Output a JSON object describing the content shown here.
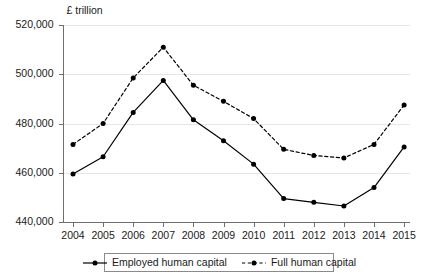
{
  "chart_data": {
    "type": "line",
    "title": "",
    "subtitle": "",
    "unit_label": "£ trillion",
    "xlabel": "",
    "ylabel": "",
    "ylim": [
      440000,
      520000
    ],
    "ytick_step": 20000,
    "ytick_labels": [
      "520,000",
      "500,000",
      "480,000",
      "460,000",
      "440,000"
    ],
    "ytick_values": [
      520000,
      500000,
      480000,
      460000,
      440000
    ],
    "categories": [
      "2004",
      "2005",
      "2006",
      "2007",
      "2008",
      "2009",
      "2010",
      "2011",
      "2012",
      "2013",
      "2014",
      "2015"
    ],
    "x": [
      2004,
      2005,
      2006,
      2007,
      2008,
      2009,
      2010,
      2011,
      2012,
      2013,
      2014,
      2015
    ],
    "grid": true,
    "grid_axis": "y",
    "legend_position": "bottom",
    "series": [
      {
        "name": "Employed human capital",
        "style": "solid",
        "color": "#000000",
        "marker": "circle",
        "values": [
          459500,
          466500,
          484500,
          497500,
          481500,
          473000,
          463500,
          449500,
          448000,
          446500,
          454000,
          470500
        ]
      },
      {
        "name": "Full human capital",
        "style": "dashed",
        "color": "#000000",
        "marker": "circle",
        "values": [
          471500,
          480000,
          498500,
          511000,
          495500,
          489000,
          482000,
          469500,
          467000,
          466000,
          471500,
          487500
        ]
      }
    ]
  },
  "legend": {
    "entries": [
      {
        "label": "Employed human capital",
        "style": "solid"
      },
      {
        "label": "Full human capital",
        "style": "dashed"
      }
    ]
  },
  "colors": {
    "series": "#000000",
    "axis": "#6f6f6f",
    "grid": "#e6e6e6",
    "text": "#1a1a1a",
    "legend_border": "#8a8a8a",
    "background": "#ffffff"
  }
}
